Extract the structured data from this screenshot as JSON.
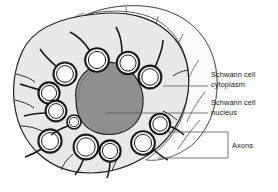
{
  "figure": {
    "type": "biological-cross-section-diagram",
    "background_color": "#ffffff",
    "line_color": "#1a1a1a"
  },
  "labels": [
    {
      "id": "schwann-cell-cytoplasm",
      "line1": "Schwann cell",
      "line2": "cytoplasm",
      "leader": "single-line"
    },
    {
      "id": "schwann-cell-nucleus",
      "line1": "Schwann cell",
      "line2": "nucleus",
      "leader": "single-line"
    },
    {
      "id": "axons",
      "line1": "Axons",
      "line2": "",
      "leader": "bracket"
    }
  ],
  "structures": {
    "cytoplasm": {
      "name": "Schwann cell cytoplasm",
      "fill": "#e9e9e9",
      "stroke": "#1a1a1a"
    },
    "nucleus": {
      "name": "Schwann cell nucleus",
      "fill": "#8f8f8f",
      "stroke": "#1a1a1a"
    },
    "axon": {
      "name": "Axon",
      "fill": "#ffffff",
      "stroke": "#1a1a1a",
      "count": 12
    },
    "lamellae": {
      "name": "Schwann cell surface lamellae",
      "fill": "#fdfdfd",
      "stroke": "#3a3a3a"
    }
  }
}
